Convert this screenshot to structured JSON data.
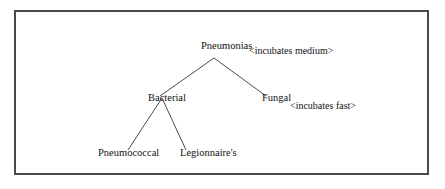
{
  "diagram": {
    "type": "tree",
    "nodes": {
      "root": {
        "label": "Pneumonias",
        "annotation": "<incubates medium>"
      },
      "bacterial": {
        "label": "Bacterial"
      },
      "fungal": {
        "label": "Fungal",
        "annotation": "<incubates fast>"
      },
      "pneumococcal": {
        "label": "Pneumococcal"
      },
      "legionnaires": {
        "label": "Legionnaire's"
      }
    },
    "edges": [
      {
        "from": "Pneumonias",
        "to": "Bacterial"
      },
      {
        "from": "Pneumonias",
        "to": "Fungal"
      },
      {
        "from": "Bacterial",
        "to": "Pneumococcal"
      },
      {
        "from": "Bacterial",
        "to": "Legionnaire's"
      }
    ],
    "colors": {
      "line": "#4a4a4a",
      "text": "#111111",
      "background": "#ffffff"
    }
  }
}
